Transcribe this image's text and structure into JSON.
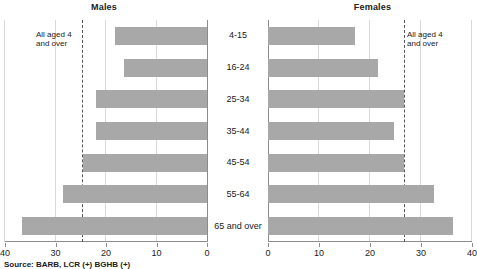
{
  "panels": {
    "left": {
      "title": "Males",
      "annotation": "All aged 4\nand over"
    },
    "right": {
      "title": "Females",
      "annotation": "All aged 4\nand over"
    }
  },
  "age_groups": [
    "4-15",
    "16-24",
    "25-34",
    "35-44",
    "45-54",
    "55-64",
    "65 and over"
  ],
  "axis_ticks_left": [
    "40",
    "30",
    "20",
    "10",
    "0"
  ],
  "axis_ticks_right": [
    "0",
    "10",
    "20",
    "30",
    "40"
  ],
  "source_note": "Source: BARB, LCR (+) BGHB (+)",
  "colors": {
    "bar_fill": "#a8a8a8",
    "gridline": "#d9d9d9",
    "axis": "#8c8c8c",
    "reference_line": "#55565a",
    "text": "#1a1a1a"
  },
  "chart_data": {
    "type": "bar",
    "title": "",
    "subtitle": "",
    "orientation": "horizontal",
    "layout": "population-pyramid",
    "categories": [
      "4-15",
      "16-24",
      "25-34",
      "35-44",
      "45-54",
      "55-64",
      "65 and over"
    ],
    "series": [
      {
        "name": "Males",
        "values": [
          18.2,
          16.4,
          22.0,
          22.0,
          24.6,
          28.5,
          36.6
        ],
        "direction": "left"
      },
      {
        "name": "Females",
        "values": [
          17.0,
          21.5,
          26.7,
          24.7,
          26.7,
          32.5,
          36.3
        ],
        "direction": "right"
      }
    ],
    "reference_lines": [
      {
        "series": "Males",
        "label": "All aged 4 and over",
        "value": 24.8
      },
      {
        "series": "Females",
        "label": "All aged 4 and over",
        "value": 26.7
      }
    ],
    "xlabel": "",
    "ylabel": "",
    "xlim": [
      0,
      40
    ],
    "xticks": [
      0,
      10,
      20,
      30,
      40
    ],
    "grid": true,
    "legend": "none"
  }
}
